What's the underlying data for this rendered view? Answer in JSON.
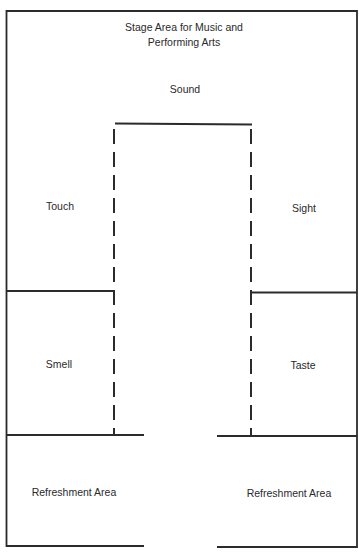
{
  "diagram": {
    "type": "floor-plan",
    "title_lines": [
      "Stage Area for Music and",
      "Performing Arts"
    ],
    "areas": {
      "sound": "Sound",
      "touch": "Touch",
      "sight": "Sight",
      "smell": "Smell",
      "taste": "Taste",
      "refreshment_left": "Refreshment Area",
      "refreshment_right": "Refreshment Area"
    },
    "line_color": "#2b2b2b",
    "text_color": "#2a2a2a"
  }
}
